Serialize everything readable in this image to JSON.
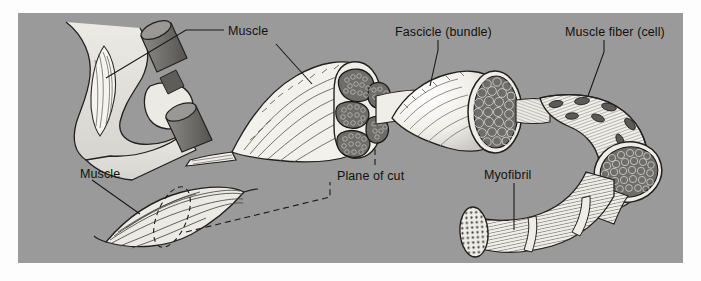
{
  "figure": {
    "background_color": "#9a9a9a",
    "panel_color": "#9a9a9a",
    "page_color": "#ffffff",
    "ink_color": "#111111",
    "fill_light": "#f2f0ea",
    "fill_mid": "#b9b7b1",
    "fill_dark": "#6f6d69"
  },
  "labels": [
    {
      "id": "muscle-arm",
      "text": "Muscle",
      "x": 228,
      "y": 24
    },
    {
      "id": "fascicle",
      "text": "Fascicle (bundle)",
      "x": 395,
      "y": 25
    },
    {
      "id": "muscle-fiber",
      "text": "Muscle fiber (cell)",
      "x": 565,
      "y": 25
    },
    {
      "id": "muscle-whole",
      "text": "Muscle",
      "x": 80,
      "y": 167
    },
    {
      "id": "plane-of-cut",
      "text": "Plane of cut",
      "x": 337,
      "y": 169
    },
    {
      "id": "myofibril",
      "text": "Myofibril",
      "x": 484,
      "y": 168
    }
  ],
  "structures": [
    {
      "id": "arm-with-dumbbell",
      "name": "Flexed arm holding dumbbell with biceps muscle"
    },
    {
      "id": "whole-muscle",
      "name": "Spindle-shaped whole muscle with cut-plane ellipse"
    },
    {
      "id": "muscle-belly-cut",
      "name": "Muscle belly sectioned showing fascicles"
    },
    {
      "id": "fascicle-tube",
      "name": "Fascicle cut open showing packed muscle fibers"
    },
    {
      "id": "fiber-tube",
      "name": "Striated muscle fiber cut open showing myofibrils"
    },
    {
      "id": "myofibril-tube",
      "name": "Striated myofibril with dotted myofilament face"
    }
  ]
}
